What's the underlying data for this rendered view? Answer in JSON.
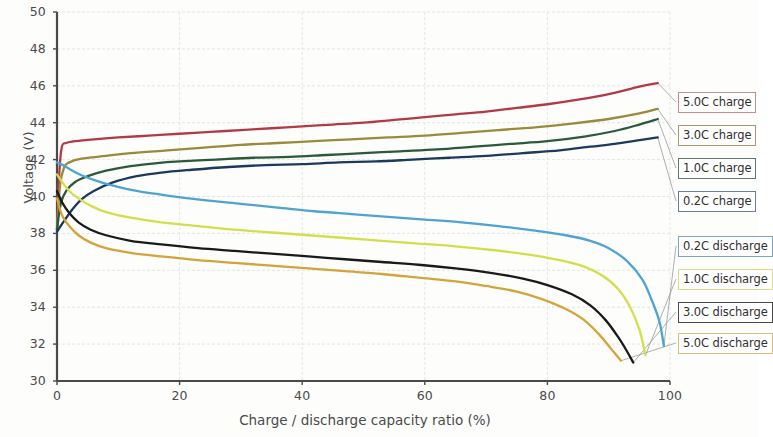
{
  "chart_data": {
    "type": "line",
    "title": "",
    "xlabel": "Charge / discharge capacity ratio (%)",
    "ylabel": "Voltage (V)",
    "xlim": [
      0,
      100
    ],
    "ylim": [
      30,
      50
    ],
    "xticks": [
      "0",
      "20",
      "40",
      "60",
      "80",
      "100"
    ],
    "yticks": [
      "30",
      "32",
      "34",
      "36",
      "38",
      "40",
      "42",
      "44",
      "46",
      "48",
      "50"
    ],
    "grid": true,
    "legend_position": "right-outside",
    "series": [
      {
        "name": "5.0C charge",
        "color": "#b03a45",
        "points": [
          [
            0,
            38.2
          ],
          [
            0.4,
            41.4
          ],
          [
            0.8,
            42.7
          ],
          [
            1.5,
            42.9
          ],
          [
            3,
            43.0
          ],
          [
            6,
            43.1
          ],
          [
            10,
            43.2
          ],
          [
            15,
            43.3
          ],
          [
            20,
            43.4
          ],
          [
            25,
            43.5
          ],
          [
            30,
            43.6
          ],
          [
            35,
            43.7
          ],
          [
            40,
            43.8
          ],
          [
            45,
            43.9
          ],
          [
            50,
            44.0
          ],
          [
            55,
            44.15
          ],
          [
            60,
            44.3
          ],
          [
            65,
            44.45
          ],
          [
            70,
            44.6
          ],
          [
            75,
            44.8
          ],
          [
            80,
            45.0
          ],
          [
            85,
            45.25
          ],
          [
            90,
            45.55
          ],
          [
            95,
            45.95
          ],
          [
            98,
            46.15
          ]
        ]
      },
      {
        "name": "3.0C charge",
        "color": "#9a8a3c",
        "points": [
          [
            0,
            38.2
          ],
          [
            0.5,
            40.6
          ],
          [
            1.2,
            41.6
          ],
          [
            2,
            41.85
          ],
          [
            4,
            42.05
          ],
          [
            8,
            42.2
          ],
          [
            12,
            42.35
          ],
          [
            18,
            42.5
          ],
          [
            24,
            42.65
          ],
          [
            30,
            42.8
          ],
          [
            36,
            42.9
          ],
          [
            42,
            43.0
          ],
          [
            48,
            43.1
          ],
          [
            54,
            43.2
          ],
          [
            60,
            43.3
          ],
          [
            66,
            43.45
          ],
          [
            72,
            43.6
          ],
          [
            78,
            43.75
          ],
          [
            84,
            43.95
          ],
          [
            90,
            44.2
          ],
          [
            95,
            44.5
          ],
          [
            98,
            44.75
          ]
        ]
      },
      {
        "name": "1.0C charge",
        "color": "#2a5a3a",
        "points": [
          [
            0,
            38.2
          ],
          [
            0.6,
            39.6
          ],
          [
            1.5,
            40.3
          ],
          [
            3,
            40.8
          ],
          [
            5,
            41.1
          ],
          [
            8,
            41.4
          ],
          [
            12,
            41.65
          ],
          [
            16,
            41.8
          ],
          [
            20,
            41.9
          ],
          [
            26,
            42.0
          ],
          [
            32,
            42.1
          ],
          [
            38,
            42.15
          ],
          [
            44,
            42.25
          ],
          [
            50,
            42.35
          ],
          [
            56,
            42.45
          ],
          [
            62,
            42.55
          ],
          [
            68,
            42.7
          ],
          [
            74,
            42.85
          ],
          [
            80,
            43.0
          ],
          [
            86,
            43.25
          ],
          [
            91,
            43.55
          ],
          [
            95,
            43.9
          ],
          [
            98,
            44.2
          ]
        ]
      },
      {
        "name": "0.2C charge",
        "color": "#1b3a5c",
        "points": [
          [
            0,
            38.1
          ],
          [
            1,
            38.6
          ],
          [
            2.5,
            39.3
          ],
          [
            4,
            39.85
          ],
          [
            6,
            40.3
          ],
          [
            9,
            40.75
          ],
          [
            13,
            41.1
          ],
          [
            17,
            41.3
          ],
          [
            22,
            41.45
          ],
          [
            28,
            41.6
          ],
          [
            34,
            41.7
          ],
          [
            40,
            41.75
          ],
          [
            46,
            41.85
          ],
          [
            52,
            41.9
          ],
          [
            58,
            42.0
          ],
          [
            64,
            42.1
          ],
          [
            70,
            42.2
          ],
          [
            76,
            42.35
          ],
          [
            82,
            42.5
          ],
          [
            87,
            42.7
          ],
          [
            91,
            42.85
          ],
          [
            95,
            43.05
          ],
          [
            98,
            43.2
          ]
        ]
      },
      {
        "name": "0.2C discharge",
        "color": "#4fa3d1",
        "points": [
          [
            0,
            41.85
          ],
          [
            1,
            41.7
          ],
          [
            2.5,
            41.4
          ],
          [
            4,
            41.15
          ],
          [
            6,
            40.9
          ],
          [
            9,
            40.6
          ],
          [
            13,
            40.3
          ],
          [
            18,
            40.05
          ],
          [
            24,
            39.8
          ],
          [
            30,
            39.6
          ],
          [
            36,
            39.4
          ],
          [
            42,
            39.2
          ],
          [
            48,
            39.05
          ],
          [
            54,
            38.9
          ],
          [
            60,
            38.75
          ],
          [
            66,
            38.6
          ],
          [
            72,
            38.4
          ],
          [
            78,
            38.15
          ],
          [
            83,
            37.9
          ],
          [
            87,
            37.6
          ],
          [
            90,
            37.2
          ],
          [
            93,
            36.5
          ],
          [
            95.5,
            35.5
          ],
          [
            97,
            34.4
          ],
          [
            98.3,
            33.2
          ],
          [
            99,
            31.9
          ]
        ]
      },
      {
        "name": "1.0C discharge",
        "color": "#d4de4c",
        "points": [
          [
            0,
            41.2
          ],
          [
            0.8,
            40.8
          ],
          [
            2,
            40.3
          ],
          [
            3.5,
            39.9
          ],
          [
            5.5,
            39.5
          ],
          [
            8,
            39.15
          ],
          [
            12,
            38.85
          ],
          [
            17,
            38.6
          ],
          [
            23,
            38.4
          ],
          [
            29,
            38.2
          ],
          [
            35,
            38.05
          ],
          [
            41,
            37.9
          ],
          [
            47,
            37.75
          ],
          [
            53,
            37.6
          ],
          [
            59,
            37.45
          ],
          [
            65,
            37.3
          ],
          [
            71,
            37.1
          ],
          [
            77,
            36.85
          ],
          [
            82,
            36.55
          ],
          [
            86,
            36.2
          ],
          [
            89,
            35.7
          ],
          [
            91.5,
            35.0
          ],
          [
            93.5,
            34.0
          ],
          [
            95,
            32.8
          ],
          [
            96,
            31.4
          ]
        ]
      },
      {
        "name": "3.0C discharge",
        "color": "#1a1a1a",
        "points": [
          [
            0,
            40.3
          ],
          [
            0.8,
            39.7
          ],
          [
            2,
            39.1
          ],
          [
            3.5,
            38.6
          ],
          [
            5.5,
            38.2
          ],
          [
            8,
            37.9
          ],
          [
            12,
            37.6
          ],
          [
            17,
            37.4
          ],
          [
            23,
            37.2
          ],
          [
            29,
            37.05
          ],
          [
            35,
            36.9
          ],
          [
            41,
            36.75
          ],
          [
            47,
            36.6
          ],
          [
            53,
            36.45
          ],
          [
            59,
            36.3
          ],
          [
            65,
            36.1
          ],
          [
            71,
            35.85
          ],
          [
            76,
            35.55
          ],
          [
            80,
            35.2
          ],
          [
            84,
            34.7
          ],
          [
            87,
            34.1
          ],
          [
            89.5,
            33.3
          ],
          [
            91.5,
            32.4
          ],
          [
            93,
            31.6
          ],
          [
            94,
            31.0
          ]
        ]
      },
      {
        "name": "5.0C discharge",
        "color": "#d3a33c",
        "points": [
          [
            0,
            39.9
          ],
          [
            0.8,
            39.0
          ],
          [
            2,
            38.4
          ],
          [
            3.5,
            37.9
          ],
          [
            5.5,
            37.5
          ],
          [
            8,
            37.2
          ],
          [
            12,
            36.95
          ],
          [
            17,
            36.75
          ],
          [
            23,
            36.55
          ],
          [
            29,
            36.4
          ],
          [
            35,
            36.25
          ],
          [
            41,
            36.1
          ],
          [
            47,
            35.95
          ],
          [
            53,
            35.8
          ],
          [
            59,
            35.6
          ],
          [
            65,
            35.4
          ],
          [
            70,
            35.15
          ],
          [
            75,
            34.85
          ],
          [
            79,
            34.45
          ],
          [
            83,
            33.9
          ],
          [
            86,
            33.3
          ],
          [
            88.5,
            32.5
          ],
          [
            90.5,
            31.7
          ],
          [
            92,
            31.1
          ]
        ]
      }
    ]
  },
  "legend": {
    "items": [
      {
        "label": "5.0C charge",
        "color": "#c98a92",
        "top": 92
      },
      {
        "label": "3.0C charge",
        "color": "#a09a6e",
        "top": 125
      },
      {
        "label": "1.0C charge",
        "color": "#5f7a6a",
        "top": 158
      },
      {
        "label": "0.2C charge",
        "color": "#6a7f94",
        "top": 191
      },
      {
        "label": "0.2C discharge",
        "color": "#7fa5bd",
        "top": 236
      },
      {
        "label": "1.0C discharge",
        "color": "#d8dd88",
        "top": 269
      },
      {
        "label": "3.0C discharge",
        "color": "#4a4a4a",
        "top": 302
      },
      {
        "label": "5.0C discharge",
        "color": "#d8c27a",
        "top": 333
      }
    ]
  },
  "axes": {
    "y_label": "Voltage (V)",
    "x_label": "Charge / discharge capacity ratio (%)",
    "y_ticks": [
      "50",
      "48",
      "46",
      "44",
      "42",
      "40",
      "38",
      "36",
      "34",
      "32",
      "30"
    ],
    "x_ticks": [
      "0",
      "20",
      "40",
      "60",
      "80",
      "100"
    ]
  }
}
